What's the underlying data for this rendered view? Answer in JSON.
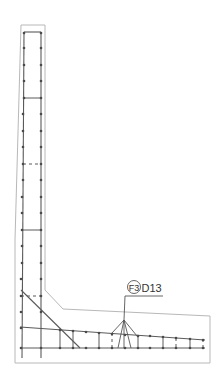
{
  "drawing": {
    "type": "retaining-wall-rebar-section",
    "callout": {
      "mark": "F3",
      "bar_size": "D13"
    },
    "colors": {
      "outline": "#b8b8b8",
      "rebar": "#5a5a5a",
      "background": "#ffffff"
    }
  }
}
